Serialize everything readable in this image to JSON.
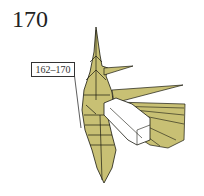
{
  "step": {
    "number": "170"
  },
  "callout": {
    "label": "162–170"
  },
  "colors": {
    "paper_colored": "#c8c074",
    "paper_white": "#ffffff",
    "line": "#1a1a10"
  }
}
